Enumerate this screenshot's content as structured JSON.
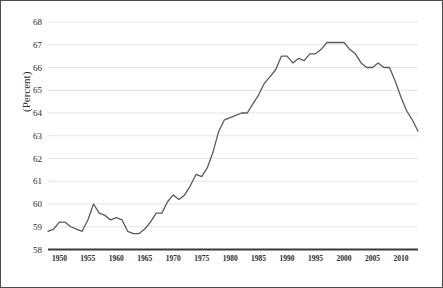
{
  "figure": {
    "border_color": "#4a4a4a",
    "background": "#ffffff"
  },
  "axis": {
    "y_title": "(Percent)",
    "y_ticks": [
      "58",
      "59",
      "60",
      "61",
      "62",
      "63",
      "64",
      "65",
      "66",
      "67",
      "68"
    ],
    "x_ticks": [
      "1950",
      "1955",
      "1960",
      "1965",
      "1970",
      "1975",
      "1980",
      "1985",
      "1990",
      "1995",
      "2000",
      "2005",
      "2010"
    ]
  },
  "style": {
    "line_color": "#5a5a5a",
    "grid_color": "#d9d9d9",
    "axis_color": "#3a3a3a",
    "text_color": "#2b2b2b"
  },
  "chart_data": {
    "type": "line",
    "title": "",
    "subtitle": "",
    "xlabel": "",
    "ylabel": "(Percent)",
    "xlim": [
      1948,
      2013
    ],
    "ylim": [
      58,
      68
    ],
    "grid": true,
    "legend": false,
    "x_tick_step": 5,
    "y_tick_step": 1,
    "series": [
      {
        "name": "Labor Force Participation Rate",
        "x": [
          1948,
          1949,
          1950,
          1951,
          1952,
          1953,
          1954,
          1955,
          1956,
          1957,
          1958,
          1959,
          1960,
          1961,
          1962,
          1963,
          1964,
          1965,
          1966,
          1967,
          1968,
          1969,
          1970,
          1971,
          1972,
          1973,
          1974,
          1975,
          1976,
          1977,
          1978,
          1979,
          1980,
          1981,
          1982,
          1983,
          1984,
          1985,
          1986,
          1987,
          1988,
          1989,
          1990,
          1991,
          1992,
          1993,
          1994,
          1995,
          1996,
          1997,
          1998,
          1999,
          2000,
          2001,
          2002,
          2003,
          2004,
          2005,
          2006,
          2007,
          2008,
          2009,
          2010,
          2011,
          2012,
          2013
        ],
        "y": [
          58.8,
          58.9,
          59.2,
          59.2,
          59.0,
          58.9,
          58.8,
          59.3,
          60.0,
          59.6,
          59.5,
          59.3,
          59.4,
          59.3,
          58.8,
          58.7,
          58.7,
          58.9,
          59.2,
          59.6,
          59.6,
          60.1,
          60.4,
          60.2,
          60.4,
          60.8,
          61.3,
          61.2,
          61.6,
          62.3,
          63.2,
          63.7,
          63.8,
          63.9,
          64.0,
          64.0,
          64.4,
          64.8,
          65.3,
          65.6,
          65.9,
          66.5,
          66.5,
          66.2,
          66.4,
          66.3,
          66.6,
          66.6,
          66.8,
          67.1,
          67.1,
          67.1,
          67.1,
          66.8,
          66.6,
          66.2,
          66.0,
          66.0,
          66.2,
          66.0,
          66.0,
          65.4,
          64.7,
          64.1,
          63.7,
          63.2
        ]
      }
    ]
  }
}
